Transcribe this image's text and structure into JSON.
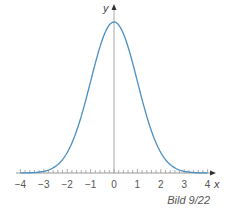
{
  "chart_data": {
    "type": "line",
    "title": "",
    "function": "standard normal density (bell curve)",
    "xlabel": "x",
    "ylabel": "y",
    "xlim": [
      -4.2,
      4.2
    ],
    "ylim": [
      0,
      0.45
    ],
    "x_ticks": [
      -4,
      -3,
      -2,
      -1,
      0,
      1,
      2,
      3,
      4
    ],
    "x_tick_labels": [
      "−4",
      "−3",
      "−2",
      "−1",
      "0",
      "1",
      "2",
      "3",
      "4"
    ],
    "minor_tick_step": 0.2,
    "grid": false,
    "legend": "none",
    "series": [
      {
        "name": "bell-curve",
        "color": "#4a90c2",
        "x": [
          -4,
          -3.5,
          -3,
          -2.5,
          -2,
          -1.5,
          -1,
          -0.5,
          0,
          0.5,
          1,
          1.5,
          2,
          2.5,
          3,
          3.5,
          4
        ],
        "y": [
          0.0001,
          0.0009,
          0.0044,
          0.0175,
          0.054,
          0.1295,
          0.242,
          0.3521,
          0.3989,
          0.3521,
          0.242,
          0.1295,
          0.054,
          0.0175,
          0.0044,
          0.0009,
          0.0001
        ]
      }
    ],
    "annotations": []
  },
  "caption": "Bild 9/22",
  "colors": {
    "curve": "#4a90c2",
    "axis": "#999999"
  }
}
